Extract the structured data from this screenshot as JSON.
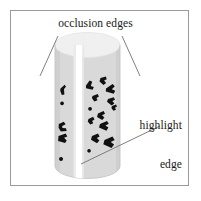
{
  "figure": {
    "caption_title": "occlusion edges",
    "labels": {
      "occlusion_edges": "occlusion edges",
      "highlight_line1": "highlight",
      "highlight_line2": "edge"
    },
    "colors": {
      "frame_border": "#9a9a9a",
      "background": "#ffffff",
      "cylinder_body": "#d8d8d8",
      "cylinder_top": "#f0f0f0",
      "cylinder_outline": "#c0c0c0",
      "highlight_stripe": "#ffffff",
      "texture_mark": "#111111",
      "leader_line": "#707070",
      "text": "#181818"
    },
    "frame": {
      "x": 10,
      "y": 10,
      "width": 179,
      "height": 176
    },
    "cylinder": {
      "left": 55,
      "right": 120,
      "top": 45,
      "bottom": 178,
      "ellipse_ry": 12,
      "highlight_stripe_x": 76,
      "highlight_stripe_width": 6
    },
    "leader_lines": [
      {
        "name": "occlusion-left",
        "x1": 58,
        "y1": 36,
        "x2": 40,
        "y2": 76
      },
      {
        "name": "occlusion-right",
        "x1": 122,
        "y1": 36,
        "x2": 140,
        "y2": 76
      },
      {
        "name": "highlight",
        "x1": 160,
        "y1": 126,
        "x2": 81,
        "y2": 164
      }
    ],
    "texture_marks": [
      "M 60.5 88.5 l 4.2 -3.8 l 1.3 2.0 l -2.0 2.3 l 0.4 5.4 l -2.6 0.6 l -1.6 -4.2 Z",
      "M 62.0 101.5 a 1.9 1.9 0 1 0 0.1 0 Z",
      "M 58.8 124.0 l 5.0 -2.2 l 1.8 2.4 l -3.4 1.9 l 0.2 2.0 l 3.6 0.1 l 0.7 2.8 l -5.9 0.4 l -2.2 -3.6 Z",
      "M 58.5 136.0 l 7.2 -2.6 l 1.6 3.0 l -3.2 1.4 l 2.6 2.6 l -1.6 2.6 l -7.0 -2.0 Z",
      "M 61.0 157.0 a 2.0 2.0 0 1 0 0.1 0 Z",
      "M 86.0 85.5 l 3.6 -5.0 l 2.6 1.2 l -1.4 4.4 l 3.0 1.0 l -1.2 2.6 l -6.6 -1.4 Z",
      "M 100.5 78.0 l 5.4 -1.4 l 0.8 2.6 l -2.6 1.4 l 2.0 2.4 l -2.6 2.0 l -4.0 -3.4 Z",
      "M 106.0 88.5 l 6.6 -4.4 l 2.2 2.2 l -3.0 3.0 l 3.4 1.4 l -1.4 3.0 l -8.0 -2.2 Z",
      "M 92.5 96.0 l 5.2 -2.0 l 1.2 2.4 l -2.4 1.6 l 1.0 2.2 l -3.2 1.2 l -2.4 -3.4 Z",
      "M 108.0 99.0 l 5.8 -1.8 l 1.2 2.6 l -2.6 1.2 l 2.0 2.6 l -2.8 1.8 l -4.6 -3.6 Z",
      "M 90.0 107.0 a 1.9 1.9 0 1 0 0.1 0 Z",
      "M 98.0 113.5 l 5.6 -2.6 l 1.4 2.8 l -3.0 1.6 l 2.4 2.2 l -2.2 2.6 l -5.2 -3.0 Z",
      "M 88.5 119.0 l 4.6 -2.2 l 1.4 2.6 l -2.4 1.6 l 1.2 2.2 l -3.0 1.4 l -2.6 -3.2 Z",
      "M 100.0 124.0 l 7.0 -3.0 l 1.8 2.8 l -3.4 1.8 l 3.0 2.0 l -2.0 3.2 l -7.4 -3.4 Z",
      "M 92.0 136.0 l 6.0 -2.4 l 1.6 3.0 l -2.8 1.4 l 2.6 2.4 l -2.4 2.8 l -6.0 -3.4 Z",
      "M 104.5 140.0 l 8.0 -3.4 l 2.2 3.4 l -4.0 2.0 l 3.4 2.4 l -2.6 3.6 l -8.2 -3.8 Z",
      "M 89.0 149.0 a 1.8 1.8 0 1 0 0.1 0 Z",
      "M 112.0 106.0 l 4.0 -1.6 l 1.0 2.2 l -2.0 1.2 l 1.0 2.0 l -2.6 1.0 l -2.0 -2.8 Z"
    ]
  }
}
